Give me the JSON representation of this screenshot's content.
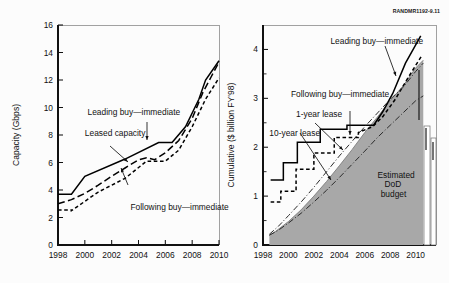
{
  "figure": {
    "credit": "RANDMR1192-9.11",
    "background_color": "#fcfcfc"
  },
  "chart_data": [
    {
      "id": "left",
      "type": "line",
      "title": "",
      "xlabel": "",
      "ylabel": "Capacity (Gbps)",
      "xlim": [
        1998,
        2010
      ],
      "ylim": [
        0,
        16
      ],
      "xticks": [
        1998,
        2000,
        2002,
        2004,
        2006,
        2008,
        2010
      ],
      "xtick_labels": [
        "1998",
        "2000",
        "2002",
        "2004",
        "2006",
        "2008",
        "2010"
      ],
      "yticks": [
        0,
        2,
        4,
        6,
        8,
        10,
        12,
        14,
        16
      ],
      "ytick_labels": [
        "0",
        "2",
        "4",
        "6",
        "8",
        "10",
        "12",
        "14",
        "16"
      ],
      "grid": false,
      "legend_position": "annotations-inline",
      "series": [
        {
          "name": "Leading buy—immediate",
          "style": "solid-step",
          "x": [
            1998,
            1999,
            1999,
            2000,
            2000,
            2003,
            2003,
            2005.5,
            2005.5,
            2006.5,
            2007.5,
            2008.5,
            2009,
            2010
          ],
          "values": [
            3.7,
            3.7,
            3.7,
            5.0,
            5.0,
            6.25,
            6.25,
            7.45,
            7.45,
            7.45,
            8.6,
            10.6,
            12.0,
            13.4
          ]
        },
        {
          "name": "Leased capacity",
          "style": "long-dash",
          "x": [
            1998,
            1999,
            2000,
            2001,
            2002,
            2003,
            2004,
            2004.6,
            2005.2,
            2006,
            2007,
            2008,
            2008.8,
            2009.4,
            2010
          ],
          "values": [
            3.0,
            3.3,
            3.75,
            4.35,
            5.0,
            5.6,
            6.2,
            6.35,
            6.2,
            6.7,
            7.6,
            9.2,
            11.1,
            12.2,
            13.3
          ]
        },
        {
          "name": "Following buy—immediate",
          "style": "short-dash-step",
          "x": [
            1998,
            1999,
            1999,
            2001,
            2001,
            2003,
            2003,
            2004.6,
            2004.6,
            2006,
            2006,
            2007,
            2008,
            2009,
            2010
          ],
          "values": [
            2.55,
            2.55,
            2.5,
            3.85,
            3.85,
            4.85,
            4.85,
            6.1,
            6.1,
            6.1,
            6.1,
            6.9,
            8.6,
            10.6,
            12.15
          ]
        }
      ],
      "annotations": [
        {
          "text": "Leading buy—immediate",
          "x": 2000.2,
          "y": 9.45
        },
        {
          "text": "Leased capacity",
          "x": 2000.0,
          "y": 7.95
        },
        {
          "text": "Following buy—immediate",
          "x": 2003.4,
          "y": 2.55
        }
      ]
    },
    {
      "id": "right",
      "type": "area-line",
      "title": "",
      "xlabel": "",
      "ylabel": "Cumulative ($ billion FY'98)",
      "xlim": [
        1998,
        2011.6
      ],
      "ylim": [
        0,
        4.5
      ],
      "xticks": [
        1998,
        2000,
        2002,
        2004,
        2006,
        2008,
        2010
      ],
      "xtick_labels": [
        "1998",
        "2000",
        "2002",
        "2004",
        "2006",
        "2008",
        "2010"
      ],
      "yticks": [
        0,
        1,
        2,
        3,
        4
      ],
      "ytick_labels": [
        "0",
        "1",
        "2",
        "3",
        "4"
      ],
      "ytick_minor": [
        0.5,
        1.5,
        2.5,
        3.5
      ],
      "grid": false,
      "legend_position": "annotations-inline",
      "series": [
        {
          "name": "Estimated DoD budget",
          "style": "filled-area",
          "x": [
            1998.5,
            1999,
            2000,
            2001,
            2002,
            2003,
            2004,
            2005,
            2006,
            2007,
            2008,
            2009,
            2010,
            2010.6
          ],
          "values": [
            0.2,
            0.28,
            0.48,
            0.72,
            1.0,
            1.3,
            1.62,
            1.95,
            2.3,
            2.62,
            2.95,
            3.25,
            3.62,
            3.78
          ]
        },
        {
          "name": "Leading buy—immediate",
          "style": "solid-step",
          "x": [
            1998.6,
            1999.6,
            1999.6,
            2000.7,
            2000.7,
            2002.5,
            2002.5,
            2004.6,
            2004.6,
            2006.7,
            2007.4,
            2008.2,
            2009.2,
            2010.4
          ],
          "values": [
            1.33,
            1.33,
            1.68,
            1.68,
            2.1,
            2.1,
            2.37,
            2.37,
            2.45,
            2.45,
            2.72,
            3.1,
            3.72,
            4.28
          ]
        },
        {
          "name": "Following buy—immediate",
          "style": "short-dash-step",
          "x": [
            1998.6,
            1999.4,
            1999.4,
            2000.6,
            2000.6,
            2002.0,
            2002.0,
            2003.6,
            2003.6,
            2005.5,
            2005.5,
            2006.6,
            2007.4,
            2008.4,
            2009.4,
            2010.5
          ],
          "values": [
            0.88,
            0.88,
            1.1,
            1.1,
            1.55,
            1.55,
            1.88,
            1.88,
            2.2,
            2.2,
            2.3,
            2.42,
            2.62,
            2.98,
            3.42,
            3.88
          ]
        },
        {
          "name": "1-year lease",
          "style": "dash-dot-light",
          "x": [
            1998.5,
            1999.2,
            2000,
            2001,
            2002,
            2003,
            2004,
            2005,
            2006,
            2007,
            2008,
            2009,
            2010,
            2010.6
          ],
          "values": [
            0.22,
            0.38,
            0.6,
            0.88,
            1.18,
            1.5,
            1.82,
            2.12,
            2.42,
            2.7,
            2.98,
            3.22,
            3.55,
            3.72
          ]
        },
        {
          "name": "10-year lease",
          "style": "dash-dot",
          "x": [
            1998.5,
            1999.2,
            2000,
            2001,
            2002,
            2003,
            2004,
            2005,
            2006,
            2007,
            2008,
            2009,
            2010,
            2010.6
          ],
          "values": [
            0.2,
            0.3,
            0.45,
            0.65,
            0.88,
            1.12,
            1.38,
            1.65,
            1.92,
            2.2,
            2.45,
            2.7,
            2.95,
            3.05
          ]
        }
      ],
      "annotations": [
        {
          "text": "Leading buy—immediate",
          "x": 2003.3,
          "y": 4.12
        },
        {
          "text": "Following buy—immediate",
          "x": 2000.2,
          "y": 3.02
        },
        {
          "text": "1-year lease",
          "x": 2000.6,
          "y": 2.62
        },
        {
          "text": "10-year lease",
          "x": 1998.5,
          "y": 2.22
        },
        {
          "text": "Estimated",
          "x": 2007.0,
          "y": 1.38
        },
        {
          "text": "DoD",
          "x": 2007.55,
          "y": 1.18
        },
        {
          "text": "budget",
          "x": 2007.25,
          "y": 0.98
        }
      ]
    }
  ]
}
